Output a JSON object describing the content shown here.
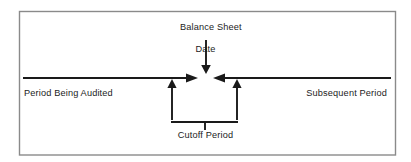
{
  "diagram": {
    "type": "timeline-diagram",
    "frame": {
      "border_color": "#8a8a8a",
      "background": "#ffffff"
    },
    "line_color": "#1a1a1a",
    "labels": {
      "balance_sheet_date_line1": "Balance Sheet",
      "balance_sheet_date_line2": "Date",
      "period_being_audited": "Period Being Audited",
      "subsequent_period": "Subsequent Period",
      "cutoff_period": "Cutoff Period"
    },
    "elements": {
      "timeline_axis": "horizontal-timeline",
      "balance_sheet_date_pointer": "down-arrow",
      "left_converging_arrow": "right-arrow",
      "right_converging_arrow": "left-arrow",
      "cutoff_left_bound_arrow": "up-arrow",
      "cutoff_right_bound_arrow": "up-arrow",
      "cutoff_bracket": "brace-bracket"
    }
  }
}
